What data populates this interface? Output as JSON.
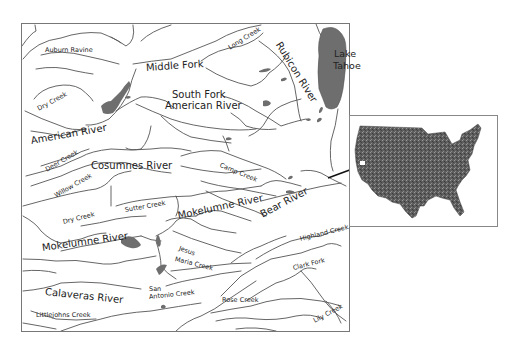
{
  "map": {
    "lake": "Lake Tahoe",
    "lake_lines": [
      "Lake",
      "Tahoe"
    ],
    "labels": {
      "auburn_ravine": "Auburn Ravine",
      "middle_fork": "Middle Fork",
      "long_creek": "Long Creek",
      "rubicon_river": "Rubicon River",
      "south_fork_1": "South Fork",
      "south_fork_2": "American River",
      "dry_creek_north": "Dry Creek",
      "american_river": "American River",
      "deer_creek": "Deer Creek",
      "cosumnes_river": "Cosumnes River",
      "camp_creek": "Camp Creek",
      "willow_creek": "Willow Creek",
      "dry_creek_south": "Dry Creek",
      "sutter_creek": "Sutter Creek",
      "mokelumne_river_east": "Mokelumne River",
      "bear_river": "Bear River",
      "mokelumne_river_west": "Mokelumne River",
      "jesus_maria_1": "Jesus",
      "jesus_maria_2": "Maria Creek",
      "highland_creek": "Highland Creek",
      "clark_fork": "Clark Fork",
      "calaveras_river": "Calaveras River",
      "san_antonio_1": "San",
      "san_antonio_2": "Antonio Creek",
      "rose_creek": "Rose Creek",
      "littlejohns_creek": "Littlejohns Creek",
      "lily_creek": "Lily Creek"
    },
    "colors": {
      "water_body": "#6e6e6e",
      "river_line": "#555555",
      "frame": "#777777"
    }
  },
  "inset": {
    "subject": "Contiguous United States locator map",
    "colors": {
      "land": "#5a5a5a",
      "marker": "#ffffff"
    }
  }
}
